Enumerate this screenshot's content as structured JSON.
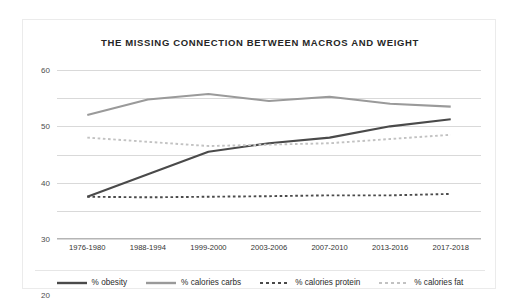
{
  "card": {
    "border_color": "#ebebeb",
    "background": "#ffffff"
  },
  "chart_data": {
    "type": "line",
    "title": "THE MISSING CONNECTION BETWEEN MACROS AND WEIGHT",
    "xlabel": "",
    "ylabel": "",
    "ylim": [
      0,
      60
    ],
    "yticks": [
      0,
      10,
      20,
      30,
      40,
      50,
      60
    ],
    "grid": true,
    "legend_position": "bottom",
    "categories": [
      "1976-1980",
      "1988-1994",
      "1999-2000",
      "2003-2006",
      "2007-2010",
      "2013-2016",
      "2017-2018"
    ],
    "series": [
      {
        "name": "% obesity",
        "values": [
          15,
          23,
          31,
          34,
          36,
          40,
          42.5
        ],
        "color": "#4a4a4a",
        "style": "solid",
        "width": 2.1
      },
      {
        "name": "% calories carbs",
        "values": [
          44,
          49.5,
          51.5,
          49,
          50.5,
          48,
          47
        ],
        "color": "#9a9a9a",
        "style": "solid",
        "width": 2.1
      },
      {
        "name": "% calories protein",
        "values": [
          15,
          14.8,
          15,
          15.2,
          15.5,
          15.5,
          16
        ],
        "color": "#4a4a4a",
        "style": "dashed",
        "width": 1.9
      },
      {
        "name": "% calories fat",
        "values": [
          36,
          34.5,
          33,
          33.5,
          34,
          35.5,
          37
        ],
        "color": "#c2c2c2",
        "style": "dashed",
        "width": 1.9
      }
    ]
  }
}
